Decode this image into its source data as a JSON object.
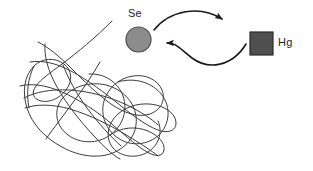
{
  "figure": {
    "title": "",
    "background_color": "#ffffff"
  },
  "labels": {
    "se": "Se",
    "hg": "Hg"
  },
  "shapes": {
    "se_circle": {
      "name": "selenium-particle",
      "shape": "circle",
      "fill": "#8c8c8c",
      "stroke": "#4d4d4d",
      "cx": 138.5,
      "cy": 39.5,
      "r": 12.5
    },
    "hg_square": {
      "name": "mercury-particle",
      "shape": "square",
      "fill": "#4f4f4f",
      "stroke": "#2b2b2b",
      "x": 250,
      "y": 32,
      "size": 23
    },
    "tangle": {
      "name": "polymer-tangle",
      "shape": "scribble",
      "stroke": "#3c3c3c",
      "stroke_width": 1
    }
  },
  "arrows": [
    {
      "name": "arrow-se-to-hg",
      "direction": "right",
      "from": "Se",
      "to": "Hg",
      "color": "#1a1a1a"
    },
    {
      "name": "arrow-hg-to-se",
      "direction": "left",
      "from": "Hg",
      "to": "Se",
      "color": "#1a1a1a"
    }
  ]
}
